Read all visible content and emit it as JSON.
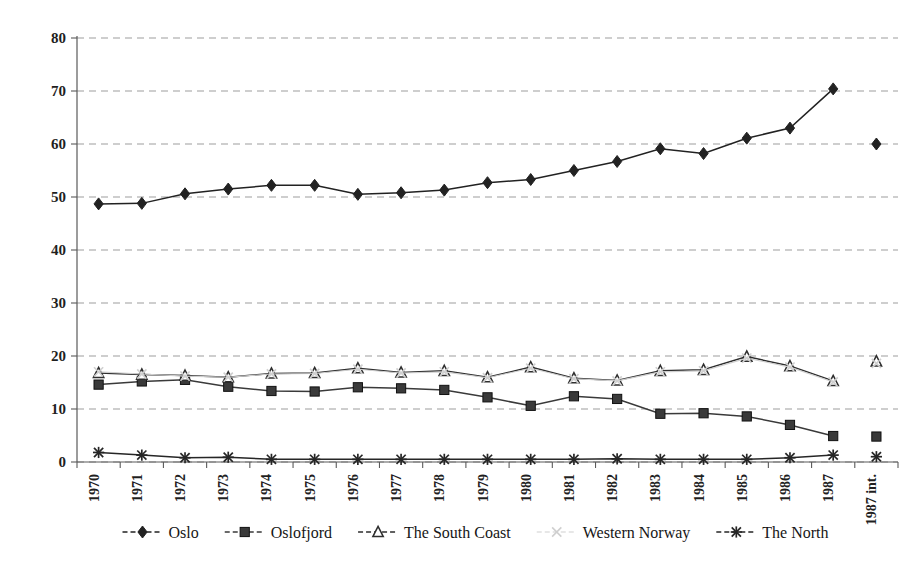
{
  "chart_data": {
    "type": "line",
    "title": "",
    "subtitle": "",
    "xlabel": "",
    "ylabel": "",
    "ylim": [
      0,
      80
    ],
    "ytick_step": 10,
    "yticks": [
      0,
      10,
      20,
      30,
      40,
      50,
      60,
      70,
      80
    ],
    "grid": true,
    "grid_style": "horizontal-dashed",
    "legend_position": "bottom",
    "categories": [
      "1970",
      "1971",
      "1972",
      "1973",
      "1974",
      "1975",
      "1976",
      "1977",
      "1978",
      "1979",
      "1980",
      "1981",
      "1982",
      "1983",
      "1984",
      "1985",
      "1986",
      "1987",
      "1987 int."
    ],
    "last_category_is_detached": true,
    "series": [
      {
        "name": "Oslo",
        "marker": "diamond",
        "color": "#222222",
        "values": [
          48.7,
          48.8,
          50.6,
          51.5,
          52.2,
          52.2,
          50.5,
          50.8,
          51.3,
          52.7,
          53.3,
          55.0,
          56.7,
          59.1,
          58.2,
          61.1,
          63.0,
          70.4,
          60.0
        ]
      },
      {
        "name": "Oslofjord",
        "marker": "square",
        "color": "#3a3a3a",
        "values": [
          14.6,
          15.2,
          15.5,
          14.2,
          13.4,
          13.3,
          14.1,
          13.9,
          13.6,
          12.2,
          10.6,
          12.4,
          11.9,
          9.1,
          9.2,
          8.6,
          7.0,
          4.9,
          4.8
        ]
      },
      {
        "name": "The South Coast",
        "marker": "triangle-open",
        "color": "#2e2e2e",
        "values": [
          16.8,
          16.5,
          16.3,
          16.0,
          16.7,
          16.8,
          17.7,
          16.9,
          17.2,
          16.0,
          17.9,
          15.8,
          15.4,
          17.2,
          17.4,
          19.9,
          18.1,
          15.3,
          19.0
        ]
      },
      {
        "name": "Western Norway",
        "marker": "x",
        "color": "#cfcfcf",
        "values": [
          17.0,
          16.6,
          16.2,
          16.0,
          16.6,
          16.7,
          17.5,
          16.8,
          17.0,
          15.9,
          17.7,
          15.7,
          15.3,
          17.0,
          17.2,
          19.6,
          17.9,
          15.1,
          18.6
        ]
      },
      {
        "name": "The North",
        "marker": "asterisk",
        "color": "#262626",
        "values": [
          1.8,
          1.3,
          0.8,
          0.9,
          0.5,
          0.5,
          0.5,
          0.5,
          0.5,
          0.5,
          0.5,
          0.5,
          0.6,
          0.5,
          0.5,
          0.5,
          0.8,
          1.3,
          1.0
        ]
      }
    ]
  },
  "legend": {
    "items": [
      {
        "label": "Oslo",
        "marker": "diamond",
        "color": "#222222"
      },
      {
        "label": "Oslofjord",
        "marker": "square",
        "color": "#3a3a3a"
      },
      {
        "label": "The South Coast",
        "marker": "triangle-open",
        "color": "#2e2e2e"
      },
      {
        "label": "Western Norway",
        "marker": "x",
        "color": "#cfcfcf"
      },
      {
        "label": "The North",
        "marker": "asterisk",
        "color": "#262626"
      }
    ]
  },
  "colors": {
    "background": "#ffffff",
    "axis": "#5a5a5a",
    "grid": "#9d9d9d",
    "text": "#1a1a1a"
  }
}
